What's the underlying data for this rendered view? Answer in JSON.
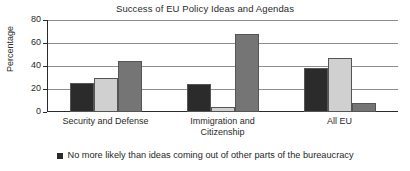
{
  "chart_data": {
    "type": "bar",
    "title": "Success of EU Policy Ideas and Agendas",
    "xlabel": "",
    "ylabel": "Percentage",
    "ylim": [
      0,
      80
    ],
    "yticks": [
      0,
      20,
      40,
      60,
      80
    ],
    "ytick_labels": [
      "0",
      "20",
      "40",
      "60",
      "80"
    ],
    "grid": true,
    "legend_position": "bottom",
    "categories": [
      "Security and Defense",
      "Immigration and Citizenship",
      "All EU"
    ],
    "category_lines": [
      [
        "Security and Defense"
      ],
      [
        "Immigration and",
        "Citizenship"
      ],
      [
        "All EU"
      ]
    ],
    "series": [
      {
        "name": "No more likely than ideas coming out of other parts of the bureaucracy",
        "color": "#2b2b2b",
        "values": [
          25,
          24,
          38
        ]
      },
      {
        "name": "",
        "color": "#d0d0d0",
        "values": [
          30,
          4,
          47
        ]
      },
      {
        "name": "",
        "color": "#757575",
        "values": [
          44,
          68,
          8
        ]
      }
    ],
    "legend": [
      {
        "label": "No more likely than ideas coming out of other parts of the bureaucracy",
        "color": "#2b2b2b",
        "marker": "square"
      }
    ]
  },
  "colors": {
    "axis": "#2a2a2a",
    "grid": "#8e8e8e",
    "background": "#ffffff",
    "series_dark": "#2b2b2b",
    "series_light": "#d0d0d0",
    "series_medium": "#757575"
  }
}
